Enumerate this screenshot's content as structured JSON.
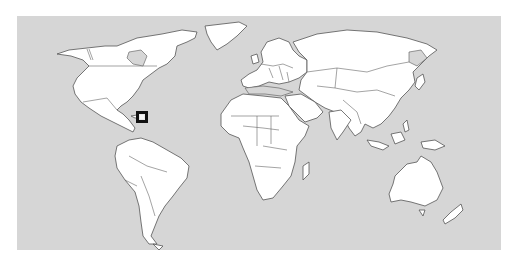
{
  "map": {
    "type": "world-political-outline",
    "colors": {
      "ocean": "#d6d6d6",
      "land": "#ffffff",
      "border": "#555555",
      "marker": "#111111"
    },
    "marker": {
      "region": "Caribbean",
      "shape": "square",
      "x": 136,
      "y": 111,
      "width": 12,
      "height": 12
    }
  }
}
